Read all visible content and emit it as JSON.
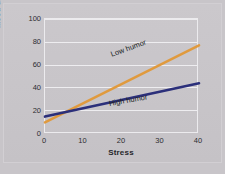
{
  "chart_data": {
    "type": "line",
    "title": "",
    "xlabel": "Stress",
    "ylabel": "Mood disturbance",
    "xlim": [
      0,
      40
    ],
    "ylim": [
      0,
      100
    ],
    "xticks": [
      0,
      10,
      20,
      30,
      40
    ],
    "yticks": [
      0,
      20,
      40,
      60,
      80,
      100
    ],
    "grid": "horizontal",
    "legend_position": "inline-series-labels",
    "series": [
      {
        "name": "Low humor",
        "color": "#e09a3e",
        "x": [
          0,
          40
        ],
        "values": [
          11,
          78
        ]
      },
      {
        "name": "High humor",
        "color": "#2b2f7a",
        "x": [
          0,
          40
        ],
        "values": [
          16,
          45
        ]
      }
    ],
    "annotations": [
      {
        "text": "Low humor",
        "series": "Low humor"
      },
      {
        "text": "High humor",
        "series": "High humor"
      }
    ]
  },
  "axes": {
    "y": {
      "title": "Mood disturbance",
      "tick_labels": [
        "100",
        "80",
        "60",
        "40",
        "20",
        "0"
      ]
    },
    "x": {
      "title": "Stress",
      "tick_labels": [
        "0",
        "10",
        "20",
        "30",
        "40"
      ]
    }
  },
  "labels": {
    "low_humor": "Low humor",
    "high_humor": "High humor"
  },
  "colors": {
    "background": "#c8c5c9",
    "gridline": "#eeedf0",
    "low_humor_line": "#e09a3e",
    "high_humor_line": "#2b2f7a",
    "text": "#2d2d31"
  }
}
